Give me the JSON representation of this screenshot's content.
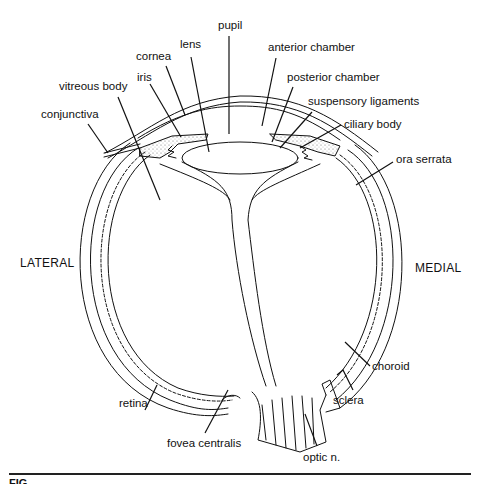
{
  "figure": {
    "type": "anatomical diagram",
    "orientation": {
      "left": "LATERAL",
      "right": "MEDIAL"
    },
    "labels": {
      "pupil": "pupil",
      "lens": "lens",
      "cornea": "cornea",
      "iris": "iris",
      "vitreous_body": "vitreous body",
      "conjunctiva": "conjunctiva",
      "anterior_chamber": "anterior chamber",
      "posterior_chamber": "posterior chamber",
      "suspensory_ligaments": "suspensory ligaments",
      "ciliary_body": "ciliary body",
      "ora_serrata": "ora serrata",
      "choroid": "choroid",
      "sclera": "sclera",
      "retina": "retina",
      "fovea_centralis": "fovea centralis",
      "optic_n": "optic n."
    },
    "caption": "FIG."
  }
}
